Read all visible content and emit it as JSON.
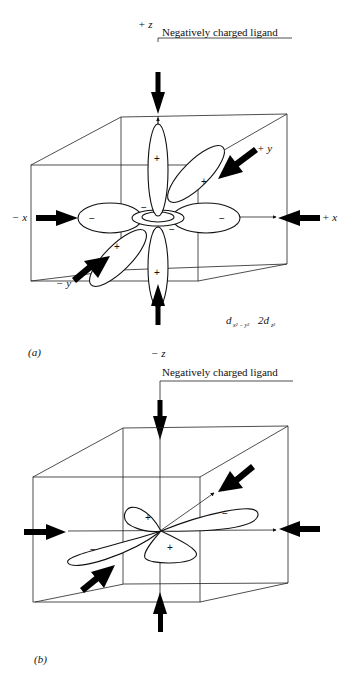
{
  "figure_a": {
    "panel_label": "(a)",
    "ligand_label": "Negatively charged ligand",
    "axis_labels": {
      "plus_z": "+ z",
      "minus_z": "− z",
      "plus_x": "+ x",
      "minus_x": "− x",
      "plus_y": "+ y",
      "minus_y": "− y"
    },
    "orbital_label": "d",
    "orbital_sub1": "x² − y²",
    "orbital_mid": "2d",
    "orbital_sub2": "z²",
    "lobe_signs": {
      "z_top": "+",
      "z_bottom": "+",
      "x_left": "−",
      "x_right": "−",
      "y_back": "+",
      "y_front": "+",
      "ring_upper": "−",
      "ring_lower": "−"
    }
  },
  "figure_b": {
    "panel_label": "(b)",
    "ligand_label": "Negatively charged ligand",
    "lobe_signs": {
      "upper_left": "+",
      "upper_right": "−",
      "lower_left": "−",
      "lower_right": "+"
    }
  }
}
